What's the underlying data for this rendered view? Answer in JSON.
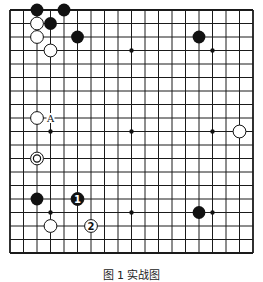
{
  "board": {
    "size": 19,
    "origin_x": 10,
    "origin_y": 10,
    "spacing": 13.5,
    "line_color": "#1a1a1a",
    "hoshi": [
      [
        3,
        3
      ],
      [
        9,
        3
      ],
      [
        15,
        3
      ],
      [
        3,
        9
      ],
      [
        9,
        9
      ],
      [
        15,
        9
      ],
      [
        3,
        15
      ],
      [
        9,
        15
      ],
      [
        15,
        15
      ]
    ],
    "black_stones": [
      [
        2,
        0
      ],
      [
        4,
        0
      ],
      [
        3,
        1
      ],
      [
        5,
        2
      ],
      [
        14,
        2
      ],
      [
        2,
        14
      ],
      [
        14,
        15
      ]
    ],
    "white_stones": [
      [
        2,
        1
      ],
      [
        2,
        2
      ],
      [
        3,
        3
      ],
      [
        2,
        8
      ],
      [
        17,
        9
      ],
      [
        3,
        16
      ]
    ],
    "marked_white": [
      [
        2,
        11
      ]
    ],
    "numbered_stones": [
      {
        "pos": [
          5,
          14
        ],
        "color": "black",
        "label": "1"
      },
      {
        "pos": [
          6,
          16
        ],
        "color": "white",
        "label": "2"
      }
    ],
    "labels": [
      {
        "pos": [
          3,
          8
        ],
        "text": "A"
      }
    ]
  },
  "caption": "图 1  实战图"
}
